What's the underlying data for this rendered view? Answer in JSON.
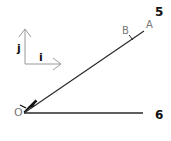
{
  "diagram": {
    "labels": {
      "origin": "O",
      "point_a": "A",
      "point_b": "B",
      "basis_i": "i",
      "basis_j": "j",
      "line_upper": "5",
      "line_lower": "6"
    },
    "colors": {
      "line": "#222222",
      "basis": "#999999",
      "text_bold": "#111111",
      "text_light": "#777777"
    }
  }
}
